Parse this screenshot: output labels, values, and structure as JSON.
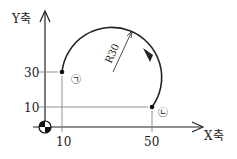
{
  "axes": {
    "y_label": "Y축",
    "x_label": "X축"
  },
  "ticks": {
    "x": [
      "10",
      "50"
    ],
    "y": [
      "30",
      "10"
    ]
  },
  "arc": {
    "radius_label": "R30"
  },
  "points": {
    "start_label": "㉠",
    "end_label": "㉡"
  },
  "colors": {
    "line": "#222222",
    "guide": "#777777"
  }
}
